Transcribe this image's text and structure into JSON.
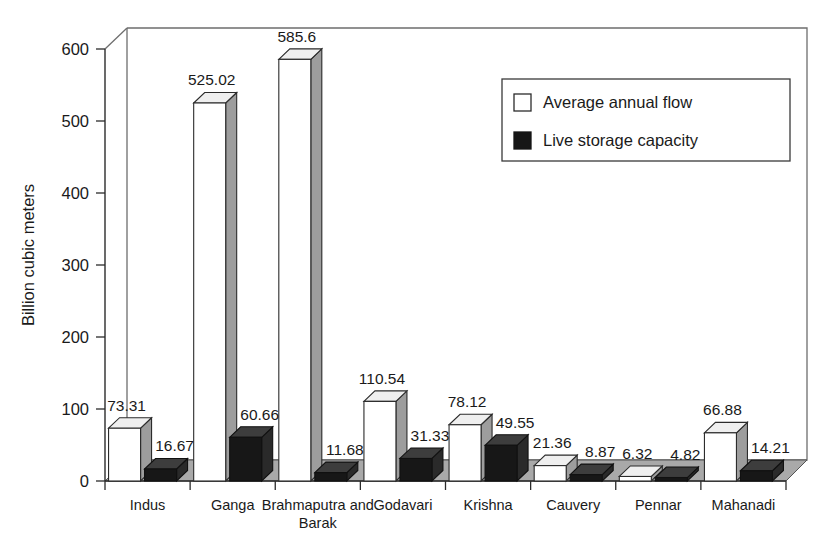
{
  "chart_data": {
    "type": "bar",
    "title": "",
    "xlabel": "",
    "ylabel": "Billion cubic meters",
    "ylim": [
      0,
      600
    ],
    "yticks": [
      0,
      100,
      200,
      300,
      400,
      500,
      600
    ],
    "ytick_labels": [
      "0",
      "100",
      "200",
      "300",
      "400",
      "500",
      "600"
    ],
    "grid": false,
    "legend_position": "upper right",
    "three_d": true,
    "categories": [
      "Indus",
      "Ganga",
      "Brahmaputra and Barak",
      "Godavari",
      "Krishna",
      "Cauvery",
      "Pennar",
      "Mahanadi"
    ],
    "category_lines": [
      [
        "Indus"
      ],
      [
        "Ganga"
      ],
      [
        "Brahmaputra and",
        "Barak"
      ],
      [
        "Godavari"
      ],
      [
        "Krishna"
      ],
      [
        "Cauvery"
      ],
      [
        "Pennar"
      ],
      [
        "Mahanadi"
      ]
    ],
    "series": [
      {
        "name": "Average annual flow",
        "color": "#ffffff",
        "values": [
          73.31,
          525.02,
          585.6,
          110.54,
          78.12,
          21.36,
          6.32,
          66.88
        ],
        "value_labels": [
          "73.31",
          "525.02",
          "585.6",
          "110.54",
          "78.12",
          "21.36",
          "6.32",
          "66.88"
        ]
      },
      {
        "name": "Live storage capacity",
        "color": "#161616",
        "values": [
          16.67,
          60.66,
          11.68,
          31.33,
          49.55,
          8.87,
          4.82,
          14.21
        ],
        "value_labels": [
          "16.67",
          "60.66",
          "11.68",
          "31.33",
          "49.55",
          "8.87",
          "4.82",
          "14.21"
        ]
      }
    ]
  },
  "legend": {
    "items": [
      {
        "label": "Average annual flow",
        "swatch": "hollow-square-icon"
      },
      {
        "label": "Live storage capacity",
        "swatch": "filled-square-icon"
      }
    ]
  },
  "axes": {
    "y_title": "Billion cubic meters"
  }
}
